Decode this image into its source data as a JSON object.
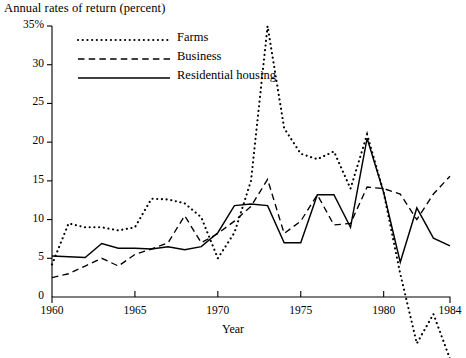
{
  "chart_data": {
    "type": "line",
    "title": "Annual rates of return  (percent)",
    "xlabel": "Year",
    "ylabel": "",
    "xlim": [
      1960,
      1984
    ],
    "ylim": [
      -10,
      35
    ],
    "grid": false,
    "legend_position": "top-left-inside",
    "y_ticks": [
      0,
      5,
      10,
      15,
      20,
      25,
      30,
      35
    ],
    "y_tick_labels": [
      "0",
      "5",
      "10",
      "15",
      "20",
      "25",
      "30",
      "35%"
    ],
    "x_ticks": [
      1960,
      1965,
      1970,
      1975,
      1980,
      1984
    ],
    "x_tick_labels": [
      "1960",
      "1965",
      "1970",
      "1975",
      "1980",
      "1984"
    ],
    "x": [
      1960,
      1961,
      1962,
      1963,
      1964,
      1965,
      1966,
      1967,
      1968,
      1969,
      1970,
      1971,
      1972,
      1973,
      1974,
      1975,
      1976,
      1977,
      1978,
      1979,
      1980,
      1981,
      1982,
      1983,
      1984
    ],
    "series": [
      {
        "name": "Farms",
        "style": "dotted",
        "values": [
          4.2,
          9.5,
          9.0,
          9.0,
          8.6,
          9.0,
          12.7,
          12.6,
          12.1,
          10.3,
          5.0,
          8.3,
          15.0,
          35.0,
          21.8,
          18.5,
          17.8,
          18.8,
          14.0,
          21.0,
          13.5,
          3.0,
          -6.0,
          -2.2,
          -8.0
        ]
      },
      {
        "name": "Business",
        "style": "dashed",
        "values": [
          2.5,
          3.0,
          4.0,
          5.0,
          4.0,
          5.5,
          6.2,
          7.0,
          10.5,
          7.0,
          8.2,
          9.8,
          11.7,
          15.2,
          8.2,
          9.8,
          13.2,
          9.3,
          9.5,
          14.2,
          14.0,
          13.3,
          10.0,
          13.3,
          15.6
        ]
      },
      {
        "name": "Residential housing",
        "style": "solid",
        "values": [
          5.3,
          5.2,
          5.1,
          6.9,
          6.3,
          6.3,
          6.2,
          6.5,
          6.1,
          6.5,
          8.3,
          11.8,
          12.0,
          11.8,
          7.0,
          7.0,
          13.2,
          13.2,
          9.0,
          20.5,
          13.5,
          4.5,
          11.5,
          7.6,
          6.6
        ]
      }
    ]
  },
  "legend": {
    "items": [
      {
        "label": "Farms",
        "key": "dotted-line-key"
      },
      {
        "label": "Business",
        "key": "dashed-line-key"
      },
      {
        "label": "Residential housing",
        "key": "solid-line-key"
      }
    ]
  }
}
